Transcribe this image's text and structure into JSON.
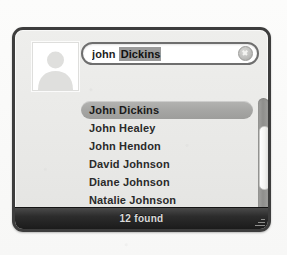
{
  "colors": {
    "panel_border": "#3d3d3d",
    "panel_background": "#eeeeec",
    "selection_highlight": "#a6a6a4",
    "status_bar_background": "#1b1b1b",
    "status_bar_text": "#dadada",
    "completion_highlight": "#9a9a9a"
  },
  "avatar": {
    "icon": "person-placeholder-icon"
  },
  "search": {
    "typed_text": "john",
    "completion_text": "Dickins",
    "full_value": "john Dickins",
    "placeholder": "Search",
    "clear_icon": "clear-circle-icon"
  },
  "results": {
    "items": [
      {
        "name": "John Dickins",
        "selected": true
      },
      {
        "name": "John Healey",
        "selected": false
      },
      {
        "name": "John Hendon",
        "selected": false
      },
      {
        "name": "David Johnson",
        "selected": false
      },
      {
        "name": "Diane Johnson",
        "selected": false
      },
      {
        "name": "Natalie Johnson",
        "selected": false
      }
    ]
  },
  "scrollbar": {
    "orientation": "vertical",
    "thumb_label": "scroll-thumb"
  },
  "status": {
    "found_text": "12 found",
    "count": 12,
    "resize_icon": "resize-grip-icon"
  }
}
